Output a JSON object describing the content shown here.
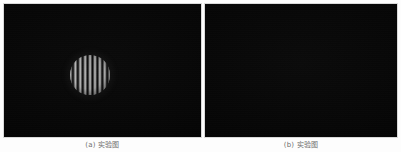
{
  "figure": {
    "background_color": "#fdfdfd",
    "panel_background": "#050505",
    "panel_border_color": "#d9d9d9",
    "fringe_peak_color": "#c4c4c4",
    "fringe_dark_color": "#0a0a0a"
  },
  "panels": [
    {
      "id": "panel-a",
      "caption": "(a) 实验图",
      "pattern": "circular-aperture-vertical-interference-fringes",
      "fringe_count": 11,
      "disc": {
        "cx": 86,
        "cy": 71,
        "r": 20
      }
    },
    {
      "id": "panel-b",
      "caption": "(b) 实验图",
      "pattern": "circular-aperture-vertical-interference-fringes",
      "fringe_count": 10,
      "disc": {
        "cx": 273,
        "cy": 70,
        "r": 20
      }
    }
  ],
  "chart_data": {
    "type": "heatmap",
    "title": "",
    "subtitle": "",
    "xlabel": "",
    "ylabel": "",
    "legend_position": "none",
    "grid": false,
    "panels": [
      {
        "label": "(a) 实验图",
        "description": "Vertical straight-line interference fringes confined to a circular aperture on a black background",
        "fringe_orientation": "vertical",
        "fringe_count": 11,
        "fringe_spacing_px": 3.6,
        "aperture_shape": "circle",
        "aperture_radius_px": 20,
        "aperture_center_px": [
          86,
          71
        ],
        "intensity_min": 10,
        "intensity_max": 196,
        "background_intensity": 5
      },
      {
        "label": "(b) 实验图",
        "description": "Vertical straight-line interference fringes confined to a circular aperture on a black background",
        "fringe_orientation": "vertical",
        "fringe_count": 10,
        "fringe_spacing_px": 3.9,
        "aperture_shape": "circle",
        "aperture_radius_px": 20,
        "aperture_center_px": [
          273,
          70
        ],
        "intensity_min": 10,
        "intensity_max": 200,
        "background_intensity": 5
      }
    ]
  }
}
